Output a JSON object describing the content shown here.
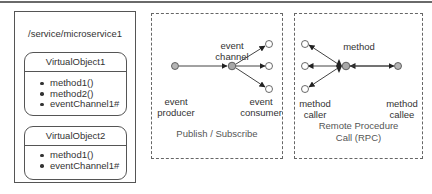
{
  "service": {
    "path": "/service/microservice1",
    "virtual_objects": [
      {
        "name": "VirtualObject1",
        "members": [
          "method1()",
          "method2()",
          "eventChannel1#"
        ]
      },
      {
        "name": "VirtualObject2",
        "members": [
          "method1()",
          "eventChannel1#"
        ]
      }
    ]
  },
  "pubsub": {
    "caption": "Publish / Subscribe",
    "labels": {
      "channel_line1": "event",
      "channel_line2": "channel",
      "producer_line1": "event",
      "producer_line2": "producer",
      "consumer_line1": "event",
      "consumer_line2": "consumer"
    },
    "colors": {
      "node_fill": "#b5b5b5",
      "endpoint_fill": "#ffffff",
      "stroke": "#444444"
    }
  },
  "rpc": {
    "caption_line1": "Remote Procedure",
    "caption_line2": "Call (RPC)",
    "labels": {
      "method": "method",
      "caller_line1": "method",
      "caller_line2": "caller",
      "callee_line1": "method",
      "callee_line2": "callee"
    }
  }
}
